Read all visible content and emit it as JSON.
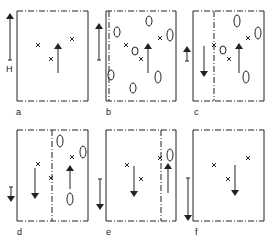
{
  "panels": [
    {
      "label": "a",
      "field_label": "H",
      "field_arrow": "up-long"
    },
    {
      "label": "b",
      "field_arrow": "up"
    },
    {
      "label": "c",
      "field_arrow": "up-short"
    },
    {
      "label": "d",
      "field_arrow": "down-short"
    },
    {
      "label": "e",
      "field_arrow": "down"
    },
    {
      "label": "f",
      "field_arrow": "down-long"
    }
  ],
  "colors": {
    "line": "#222222",
    "background": "#ffffff"
  }
}
